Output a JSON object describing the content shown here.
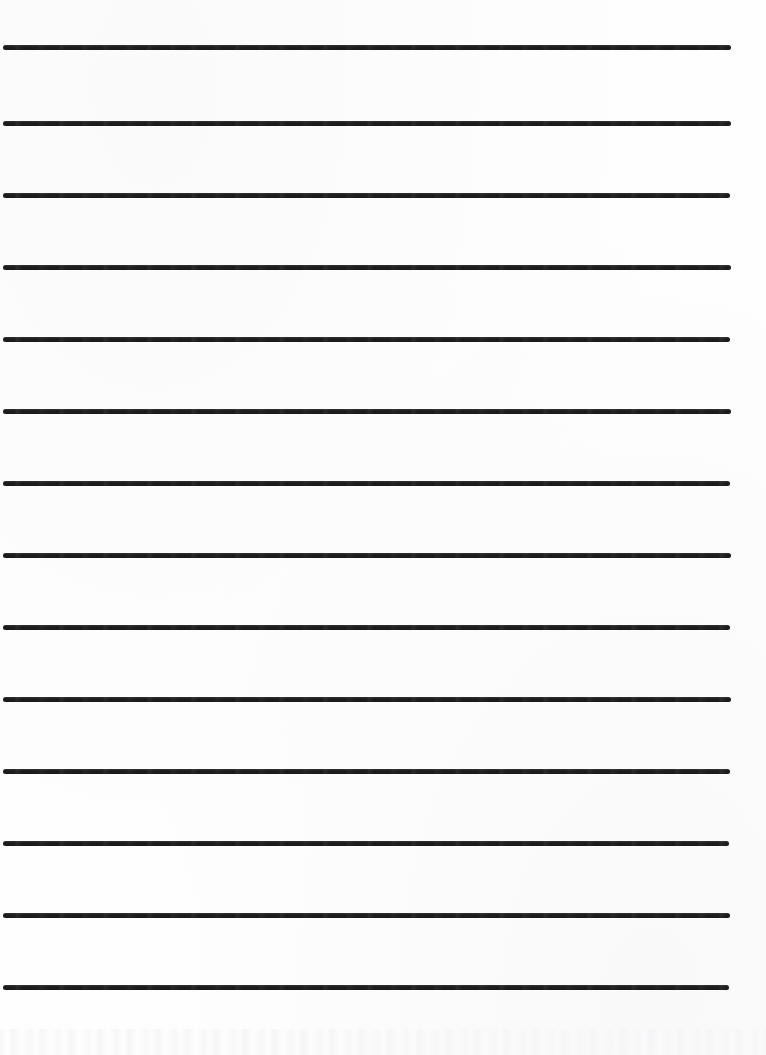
{
  "document": {
    "kind": "ruled-writing-sheet",
    "description": "Blank lined handwriting practice paper",
    "page_width": 766,
    "page_height": 1055,
    "background_color": "#fefefe",
    "text_content": "",
    "visible_text": []
  },
  "ruling": {
    "line_color": "#1f1f1f",
    "line_count": 14,
    "line_thickness": 5,
    "line_spacing": 72,
    "left_margin": 3,
    "right_margin": 35,
    "lines": [
      {
        "index": 1,
        "y": 47,
        "x_start": 3,
        "x_end": 731,
        "thickness": 5
      },
      {
        "index": 2,
        "y": 123,
        "x_start": 3,
        "x_end": 731,
        "thickness": 5
      },
      {
        "index": 3,
        "y": 195,
        "x_start": 3,
        "x_end": 730,
        "thickness": 5
      },
      {
        "index": 4,
        "y": 267,
        "x_start": 3,
        "x_end": 731,
        "thickness": 5
      },
      {
        "index": 5,
        "y": 339,
        "x_start": 3,
        "x_end": 730,
        "thickness": 5
      },
      {
        "index": 6,
        "y": 411,
        "x_start": 3,
        "x_end": 731,
        "thickness": 5
      },
      {
        "index": 7,
        "y": 483,
        "x_start": 3,
        "x_end": 730,
        "thickness": 5
      },
      {
        "index": 8,
        "y": 555,
        "x_start": 3,
        "x_end": 731,
        "thickness": 5
      },
      {
        "index": 9,
        "y": 627,
        "x_start": 3,
        "x_end": 730,
        "thickness": 5
      },
      {
        "index": 10,
        "y": 699,
        "x_start": 3,
        "x_end": 731,
        "thickness": 5
      },
      {
        "index": 11,
        "y": 771,
        "x_start": 3,
        "x_end": 730,
        "thickness": 5
      },
      {
        "index": 12,
        "y": 843,
        "x_start": 3,
        "x_end": 729,
        "thickness": 5
      },
      {
        "index": 13,
        "y": 915,
        "x_start": 3,
        "x_end": 730,
        "thickness": 5
      },
      {
        "index": 14,
        "y": 987,
        "x_start": 3,
        "x_end": 729,
        "thickness": 5
      }
    ]
  }
}
